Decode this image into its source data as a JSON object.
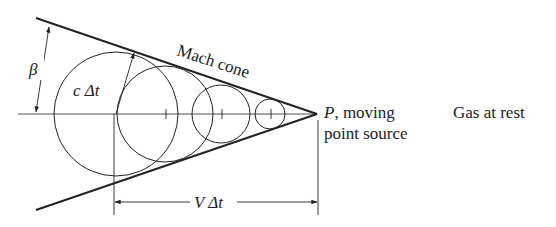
{
  "figure": {
    "labels": {
      "beta": "β",
      "c_dt": "c Δt",
      "mach_cone": "Mach cone",
      "p_line1": "P, moving",
      "p_line1_symbol": "P",
      "p_line1_rest": ", moving",
      "p_line2": "point source",
      "gas_at_rest": "Gas at rest",
      "v_dt": "V Δt"
    },
    "geometry": {
      "axis_y": 114,
      "apex": {
        "x": 317,
        "y": 114
      },
      "cone_upper_start": {
        "x": 36,
        "y": 18
      },
      "cone_lower_start": {
        "x": 36,
        "y": 210
      },
      "circles": [
        {
          "cx": 116,
          "cy": 114,
          "r": 62
        },
        {
          "cx": 165,
          "cy": 114,
          "r": 48
        },
        {
          "cx": 221,
          "cy": 114,
          "r": 29
        },
        {
          "cx": 270,
          "cy": 114,
          "r": 15
        }
      ],
      "dimension_line_y": 202
    },
    "colors": {
      "stroke": "#222222",
      "background": "#ffffff"
    }
  }
}
